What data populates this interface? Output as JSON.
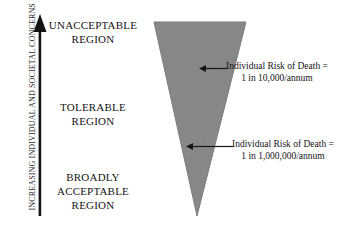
{
  "diagram": {
    "type": "risk-tolerability-triangle",
    "background_color": "#ffffff",
    "axis": {
      "caption": "INCREASING INDIVIDUAL AND SOCIETAL CONCERNS",
      "direction": "up",
      "color": "#141414"
    },
    "regions": [
      {
        "id": "unacceptable",
        "label": "UNACCEPTABLE\nREGION",
        "line1": "UNACCEPTABLE",
        "line2": "REGION",
        "line3": ""
      },
      {
        "id": "tolerable",
        "label": "TOLERABLE\nREGION",
        "line1": "TOLERABLE",
        "line2": "REGION",
        "line3": ""
      },
      {
        "id": "broadly-acceptable",
        "label": "BROADLY\nACCEPTABLE\nREGION",
        "line1": "BROADLY",
        "line2": "ACCEPTABLE",
        "line3": "REGION"
      }
    ],
    "triangle": {
      "orientation": "point-down",
      "fill_color": "#808080",
      "stroke_color": "#6e6e6e"
    },
    "callouts": [
      {
        "id": "upper-risk",
        "line1": "Individual Risk of Death =",
        "line2": "1 in 10,000/annum",
        "arrow_direction": "left"
      },
      {
        "id": "lower-risk",
        "line1": "Individual Risk of Death =",
        "line2": "1 in 1,000,000/annum",
        "arrow_direction": "left"
      }
    ]
  }
}
